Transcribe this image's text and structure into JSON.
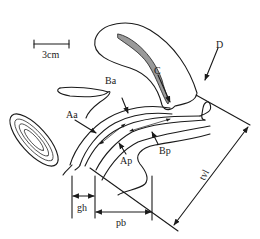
{
  "diagram": {
    "scale_bar": {
      "label": "3cm"
    },
    "points": [
      {
        "id": "Aa",
        "label": "Aa"
      },
      {
        "id": "Ba",
        "label": "Ba"
      },
      {
        "id": "C",
        "label": "C"
      },
      {
        "id": "D",
        "label": "D"
      },
      {
        "id": "Ap",
        "label": "Ap"
      },
      {
        "id": "Bp",
        "label": "Bp"
      }
    ],
    "measurements": [
      {
        "id": "gh",
        "label": "gh"
      },
      {
        "id": "pb",
        "label": "pb"
      },
      {
        "id": "tvl",
        "label": "tvl"
      }
    ],
    "colors": {
      "line": "#1a1a1a",
      "cervix_fill": "#9a9a9a",
      "background": "#ffffff"
    }
  }
}
